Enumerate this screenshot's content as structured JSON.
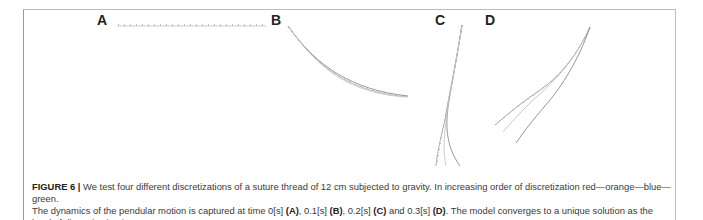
{
  "figure": {
    "panels": [
      {
        "label": "A",
        "time": "0[s]"
      },
      {
        "label": "B",
        "time": "0.1[s]"
      },
      {
        "label": "C",
        "time": "0.2[s]"
      },
      {
        "label": "D",
        "time": "0.3[s]"
      }
    ],
    "discretization_order": [
      "red",
      "orange",
      "blue",
      "green"
    ]
  },
  "caption": {
    "figure_label": "FIGURE 6 |",
    "line1": " We test four different discretizations of a suture thread of 12 cm subjected to gravity. In increasing order of discretization red—orange—blue—green.",
    "line2_prefix": "The dynamics of the pendular motion is captured at time 0[s] ",
    "ref_a": "(A)",
    "sep_ab": ", 0.1[s] ",
    "ref_b": "(B)",
    "sep_bc": ", 0.2[s] ",
    "ref_c": "(C)",
    "sep_cd": " and 0.3[s] ",
    "ref_d": "(D)",
    "line2_suffix": ". The model converges to a unique solution as the level of discretization increases."
  }
}
